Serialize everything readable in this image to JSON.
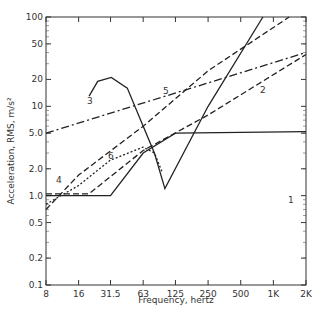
{
  "chart_data": {
    "type": "line",
    "title": "",
    "xlabel": "Frequency, hertz",
    "ylabel": "Acceleration, RMS, m/s²",
    "xscale": "log2",
    "yscale": "log10",
    "xlim": [
      8,
      2000
    ],
    "ylim": [
      0.1,
      100
    ],
    "x_ticks": [
      "8",
      "16",
      "31.5",
      "63",
      "125",
      "250",
      "500",
      "1K",
      "2K"
    ],
    "y_ticks": [
      "0.1",
      "0.2",
      "0.5",
      "1.0",
      "2.0",
      "5.0",
      "10",
      "20",
      "50",
      "100"
    ],
    "series": [
      {
        "name": "1",
        "style": "solid",
        "points": [
          [
            8,
            1.0
          ],
          [
            31.5,
            1.0
          ],
          [
            63,
            3.0
          ],
          [
            125,
            5.0
          ],
          [
            2000,
            5.2
          ]
        ]
      },
      {
        "name": "2",
        "style": "dashed",
        "points": [
          [
            8,
            1.05
          ],
          [
            20,
            1.05
          ],
          [
            63,
            3.2
          ],
          [
            250,
            8
          ],
          [
            2000,
            38
          ]
        ]
      },
      {
        "name": "3",
        "style": "solid",
        "points": [
          [
            20,
            13
          ],
          [
            24,
            19
          ],
          [
            32,
            21
          ],
          [
            45,
            16
          ],
          [
            63,
            6
          ],
          [
            80,
            3
          ],
          [
            100,
            1.2
          ],
          [
            250,
            10
          ],
          [
            800,
            100
          ]
        ]
      },
      {
        "name": "4",
        "style": "dashed",
        "points": [
          [
            8,
            0.7
          ],
          [
            16,
            1.7
          ],
          [
            63,
            6
          ],
          [
            250,
            25
          ],
          [
            1400,
            100
          ]
        ]
      },
      {
        "name": "5",
        "style": "dash-dot",
        "points": [
          [
            8,
            5.0
          ],
          [
            2000,
            40
          ]
        ]
      },
      {
        "name": "6",
        "style": "dotted",
        "points": [
          [
            8,
            0.8
          ],
          [
            16,
            1.3
          ],
          [
            31.5,
            2.5
          ],
          [
            63,
            3.5
          ],
          [
            80,
            3.0
          ],
          [
            95,
            1.8
          ]
        ]
      }
    ]
  },
  "labels": {
    "x": "Frequency, hertz",
    "y": "Acceleration, RMS, m/s²"
  }
}
